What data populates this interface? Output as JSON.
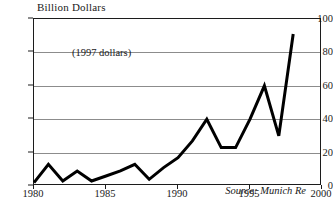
{
  "chart_data": {
    "type": "line",
    "title": "Billion Dollars",
    "xlabel": "",
    "ylabel": "Billion Dollars",
    "annotation": "(1997 dollars)",
    "source": "Source: Munich Re",
    "grid": true,
    "legend": "none",
    "xlim": [
      1980,
      2000
    ],
    "ylim": [
      0,
      100
    ],
    "ytick_labels": [
      "0",
      "20",
      "40",
      "60",
      "80",
      "100"
    ],
    "ytick_values": [
      0,
      20,
      40,
      60,
      80,
      100
    ],
    "xtick_labels": [
      "1980",
      "1985",
      "1990",
      "1995",
      "2000"
    ],
    "xtick_values": [
      1980,
      1985,
      1990,
      1995,
      2000
    ],
    "x": [
      1980,
      1981,
      1982,
      1983,
      1984,
      1985,
      1986,
      1987,
      1988,
      1989,
      1990,
      1991,
      1992,
      1993,
      1994,
      1995,
      1996,
      1997,
      1998
    ],
    "values": [
      2,
      13,
      3,
      9,
      3,
      6,
      9,
      13,
      4,
      11,
      17,
      27,
      40,
      23,
      23,
      40,
      60,
      30,
      91
    ],
    "series": [
      {
        "name": "Weather-related insured losses",
        "color": "#000000",
        "values": [
          2,
          13,
          3,
          9,
          3,
          6,
          9,
          13,
          4,
          11,
          17,
          27,
          40,
          23,
          23,
          40,
          60,
          30,
          91
        ]
      }
    ]
  },
  "colors": {
    "line": "#000000",
    "grid": "#8c8c8c",
    "frame": "#1c1c1c",
    "background": "#ffffff"
  }
}
